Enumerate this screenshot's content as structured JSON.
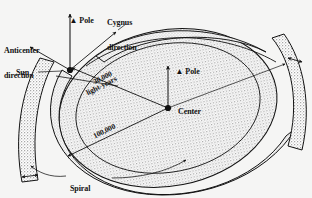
{
  "figure": {
    "background_color": "#f5f5f4",
    "ink_color": "#121212",
    "stipple_color": "#9a9a9a"
  },
  "labels": {
    "pole_top": "Pole",
    "cygnus_line1": "Cygnus",
    "cygnus_line2": "direction",
    "anticenter_line1": "Anticenter",
    "anticenter_line2": "direction",
    "sun": "Sun",
    "pole_center": "Pole",
    "center": "Center",
    "spiral_line1": "Spiral",
    "spiral_line2": "arms",
    "distance_sun_to_center": "30,000",
    "distance_units": "light-years",
    "galaxy_diameter": "100,000"
  },
  "icons": {
    "pole_arrow": "up-arrow-icon",
    "cygnus_arrow": "diagonal-arrow-icon",
    "anticenter_arrow": "diagonal-arrow-icon",
    "sun_marker": "filled-dot-icon",
    "center_marker": "filled-dot-icon",
    "spiral_leader": "curved-leader-line-icon"
  }
}
